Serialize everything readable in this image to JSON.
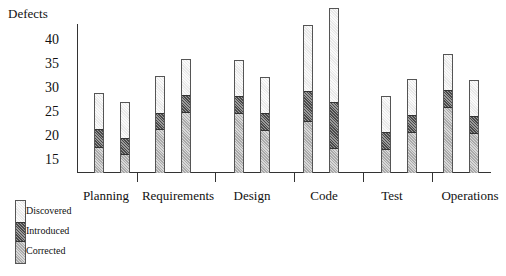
{
  "chart_data": {
    "type": "bar",
    "stacked": true,
    "title": "",
    "xlabel": "",
    "ylabel": "Defects",
    "ylim": [
      12.7,
      47
    ],
    "yticks": [
      15,
      20,
      25,
      30,
      35,
      40
    ],
    "grid": false,
    "legend_position": "bottom-left",
    "categories": [
      "Planning",
      "Requirements",
      "Design",
      "Code",
      "Test",
      "Operations"
    ],
    "bars_per_category": 2,
    "series": [
      {
        "name": "Corrected",
        "values": [
          [
            18.0,
            16.5
          ],
          [
            21.7,
            25.2
          ],
          [
            25.0,
            21.5
          ],
          [
            23.3,
            17.7
          ],
          [
            17.5,
            21.0
          ],
          [
            26.2,
            20.8
          ]
        ]
      },
      {
        "name": "Introduced",
        "values": [
          [
            21.9,
            20.0
          ],
          [
            25.2,
            29.0
          ],
          [
            28.8,
            25.2
          ],
          [
            29.8,
            27.5
          ],
          [
            21.2,
            24.8
          ],
          [
            30.0,
            24.6
          ]
        ]
      },
      {
        "name": "Discovered",
        "values": [
          [
            29.2,
            27.3
          ],
          [
            32.7,
            36.3
          ],
          [
            36.0,
            32.5
          ],
          [
            43.3,
            46.9
          ],
          [
            28.5,
            32.1
          ],
          [
            37.3,
            31.9
          ]
        ]
      }
    ],
    "note": "values are cumulative stack tops on the y-axis"
  },
  "axis": {
    "ylabel": "Defects",
    "yticks": [
      "40",
      "35",
      "30",
      "25",
      "20",
      "15"
    ]
  },
  "categories": [
    "Planning",
    "Requirements",
    "Design",
    "Code",
    "Test",
    "Operations"
  ],
  "legend": {
    "items": [
      "Discovered",
      "Introduced",
      "Corrected"
    ]
  }
}
